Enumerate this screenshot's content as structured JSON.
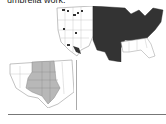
{
  "document": {
    "caption_text": "umbrella work."
  },
  "figures": {
    "main_map": {
      "subject": "united-states-map",
      "highlight_color": "#333333",
      "base_color": "#ffffff"
    },
    "inset_map": {
      "subject": "western-central-states-map",
      "highlight_color": "#b8b8b8",
      "base_color": "#ffffff"
    }
  }
}
